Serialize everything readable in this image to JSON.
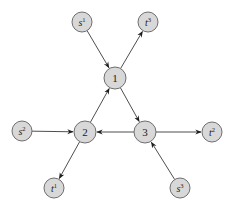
{
  "diagram": {
    "type": "directed-graph",
    "nodes": [
      {
        "id": "s1",
        "base": "s",
        "sup": "1",
        "kind": "source"
      },
      {
        "id": "t3",
        "base": "t",
        "sup": "3",
        "kind": "sink"
      },
      {
        "id": "n1",
        "base": "1",
        "sup": "",
        "kind": "internal"
      },
      {
        "id": "s2",
        "base": "s",
        "sup": "2",
        "kind": "source"
      },
      {
        "id": "n2",
        "base": "2",
        "sup": "",
        "kind": "internal"
      },
      {
        "id": "n3",
        "base": "3",
        "sup": "",
        "kind": "internal"
      },
      {
        "id": "t2",
        "base": "t",
        "sup": "2",
        "kind": "sink"
      },
      {
        "id": "t1",
        "base": "t",
        "sup": "1",
        "kind": "sink"
      },
      {
        "id": "s3",
        "base": "s",
        "sup": "3",
        "kind": "source"
      }
    ],
    "edges": [
      {
        "from": "s1",
        "to": "n1"
      },
      {
        "from": "n1",
        "to": "t3"
      },
      {
        "from": "n1",
        "to": "n3"
      },
      {
        "from": "n2",
        "to": "n1"
      },
      {
        "from": "s2",
        "to": "n2"
      },
      {
        "from": "n3",
        "to": "n2"
      },
      {
        "from": "n3",
        "to": "t2"
      },
      {
        "from": "n2",
        "to": "t1"
      },
      {
        "from": "s3",
        "to": "n3"
      }
    ],
    "colors": {
      "node_fill": "#d8d8d8",
      "node_stroke": "#6e6e6e",
      "edge": "#3a3a3a"
    }
  }
}
